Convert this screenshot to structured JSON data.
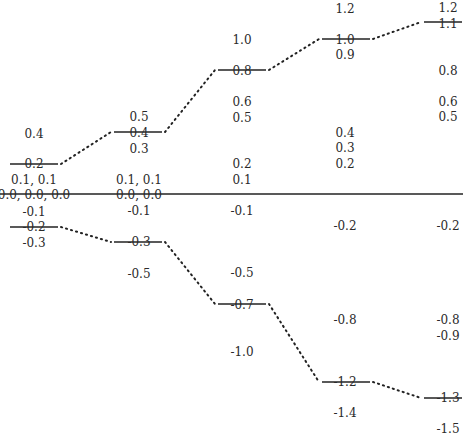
{
  "diagram": {
    "type": "energy-level-correlation-diagram",
    "zero_line": {
      "y": 194,
      "x1": 0,
      "x2": 463
    },
    "line_color": "#222222",
    "columns": [
      {
        "id": "col1",
        "center_x": 34,
        "upper_level": {
          "value": "0.2",
          "y": 164,
          "x1": 10,
          "x2": 58
        },
        "lower_level": {
          "value": "-0.2",
          "y": 227,
          "x1": 10,
          "x2": 58
        },
        "labels": [
          {
            "text": "0.4",
            "y": 134
          },
          {
            "text": "0.2",
            "y": 164
          },
          {
            "text": "0.1, 0.1",
            "y": 180
          },
          {
            "text": "0.0, 0.0, 0.0",
            "y": 195
          },
          {
            "text": "-0.1",
            "y": 212
          },
          {
            "text": "-0.2",
            "y": 227
          },
          {
            "text": "-0.3",
            "y": 243
          }
        ]
      },
      {
        "id": "col2",
        "center_x": 139,
        "upper_level": {
          "value": "0.4",
          "y": 132,
          "x1": 114,
          "x2": 162
        },
        "lower_level": {
          "value": "-0.3",
          "y": 242,
          "x1": 114,
          "x2": 162
        },
        "labels": [
          {
            "text": "0.5",
            "y": 117
          },
          {
            "text": "0.4",
            "y": 133
          },
          {
            "text": "0.3",
            "y": 149
          },
          {
            "text": "0.1, 0.1",
            "y": 180
          },
          {
            "text": "0.0, 0.0",
            "y": 195
          },
          {
            "text": "-0.1",
            "y": 211
          },
          {
            "text": "-0.3",
            "y": 242
          },
          {
            "text": "-0.5",
            "y": 274
          }
        ]
      },
      {
        "id": "col3",
        "center_x": 242,
        "upper_level": {
          "value": "0.8",
          "y": 70,
          "x1": 218,
          "x2": 266
        },
        "lower_level": {
          "value": "-0.7",
          "y": 304,
          "x1": 218,
          "x2": 266
        },
        "labels": [
          {
            "text": "1.0",
            "y": 40
          },
          {
            "text": "0.8",
            "y": 71
          },
          {
            "text": "0.6",
            "y": 102
          },
          {
            "text": "0.5",
            "y": 118
          },
          {
            "text": "0.2",
            "y": 164
          },
          {
            "text": "0.1",
            "y": 180
          },
          {
            "text": "-0.1",
            "y": 211
          },
          {
            "text": "-0.5",
            "y": 273
          },
          {
            "text": "-0.7",
            "y": 305
          },
          {
            "text": "-1.0",
            "y": 352
          }
        ]
      },
      {
        "id": "col4",
        "center_x": 345,
        "upper_level": {
          "value": "1.0",
          "y": 39,
          "x1": 322,
          "x2": 370
        },
        "lower_level": {
          "value": "-1.2",
          "y": 382,
          "x1": 322,
          "x2": 370
        },
        "labels": [
          {
            "text": "1.2",
            "y": 9
          },
          {
            "text": "1.0",
            "y": 40
          },
          {
            "text": "0.9",
            "y": 55
          },
          {
            "text": "0.4",
            "y": 133
          },
          {
            "text": "0.3",
            "y": 148
          },
          {
            "text": "0.2",
            "y": 164
          },
          {
            "text": "-0.2",
            "y": 226
          },
          {
            "text": "-0.8",
            "y": 320
          },
          {
            "text": "-1.2",
            "y": 382
          },
          {
            "text": "-1.4",
            "y": 413
          }
        ]
      },
      {
        "id": "col5",
        "center_x": 448,
        "upper_level": {
          "value": "1.1",
          "y": 22,
          "x1": 424,
          "x2": 462
        },
        "lower_level": {
          "value": "-1.3",
          "y": 398,
          "x1": 424,
          "x2": 462
        },
        "labels": [
          {
            "text": "1.2",
            "y": 8
          },
          {
            "text": "1.1",
            "y": 24
          },
          {
            "text": "0.8",
            "y": 71
          },
          {
            "text": "0.6",
            "y": 102
          },
          {
            "text": "0.5",
            "y": 117
          },
          {
            "text": "-0.2",
            "y": 226
          },
          {
            "text": "-0.8",
            "y": 320
          },
          {
            "text": "-0.9",
            "y": 336
          },
          {
            "text": "-1.3",
            "y": 398
          },
          {
            "text": "-1.5",
            "y": 429
          }
        ]
      }
    ]
  }
}
